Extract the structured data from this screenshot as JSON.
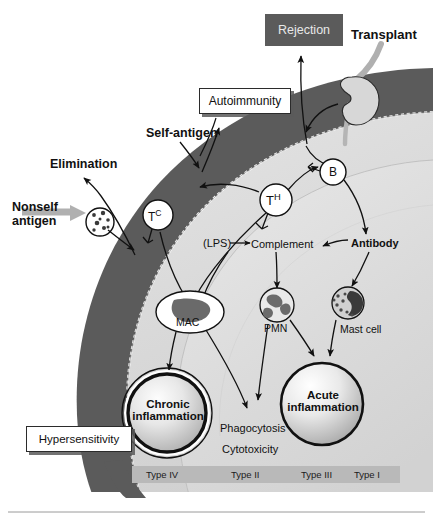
{
  "callouts": {
    "rejection": {
      "label": "Rejection",
      "style": "dark",
      "bg": "#5b5b5b",
      "fg": "#e8e8e8"
    },
    "autoimmunity": {
      "label": "Autoimmunity",
      "style": "light",
      "bg": "#ffffff",
      "fg": "#111111"
    },
    "hypersensitivity": {
      "label": "Hypersensitivity",
      "style": "light",
      "bg": "#ffffff",
      "fg": "#111111"
    }
  },
  "external_labels": {
    "transplant": "Transplant",
    "self_antigen": "Self-antigen",
    "elimination": "Elimination",
    "nonself_antigen_line1": "Nonself",
    "nonself_antigen_line2": "antigen"
  },
  "cells": {
    "tc": {
      "name": "T",
      "superscript": "C",
      "full": "TC"
    },
    "th": {
      "name": "T",
      "superscript": "H",
      "full": "TH"
    },
    "b": {
      "name": "B",
      "superscript": "",
      "full": "B"
    },
    "mac": {
      "label": "MAC"
    },
    "pmn": {
      "label": "PMN"
    },
    "mast": {
      "label": "Mast cell"
    }
  },
  "mediators": {
    "lps": "(LPS)",
    "complement": "Complement",
    "antibody": "Antibody"
  },
  "outcomes": {
    "chronic_line1": "Chronic",
    "chronic_line2": "inflammation",
    "acute_line1": "Acute",
    "acute_line2": "inflammation",
    "phagocytosis": "Phagocytosis",
    "cytotoxicity": "Cytotoxicity"
  },
  "type_bar": {
    "background": "#b9b9b9",
    "items": [
      {
        "label": "Type IV"
      },
      {
        "label": "Type II"
      },
      {
        "label": "Type III"
      },
      {
        "label": "Type I"
      }
    ]
  },
  "colors": {
    "outer_band": "#5b5b5b",
    "inner_body": "#d9d9d9",
    "inner_core": "#dcdcdc",
    "stroke": "#111111",
    "gray_arrow": "#a8a8a8",
    "kidney_fill": "#d5d5d5",
    "type_bar": "#b9b9b9",
    "page_rule": "#9a9a9a"
  }
}
